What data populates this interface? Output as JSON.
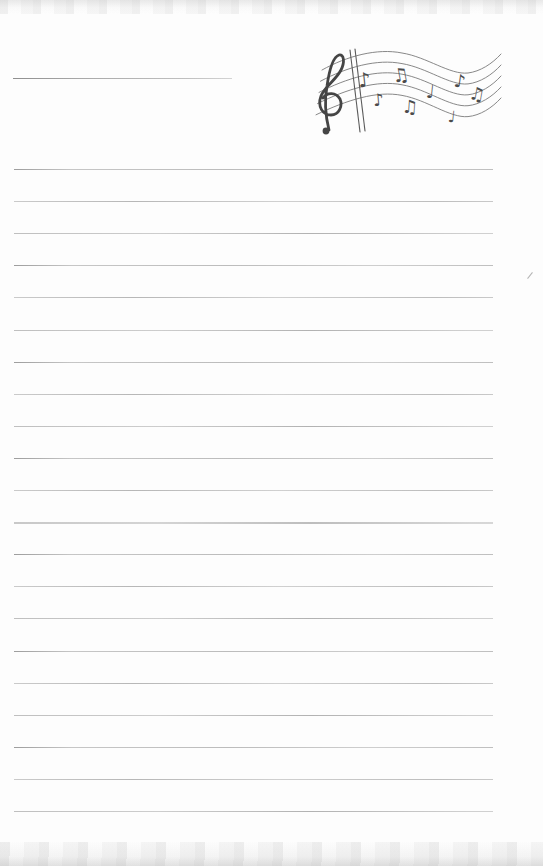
{
  "page": {
    "background_color": "#fdfdfd",
    "edge_texture_color": "#dcdcdc"
  },
  "title_line": {
    "color": "#9e9e9e"
  },
  "ruled_lines": {
    "count": 21,
    "start_y": 169,
    "spacing": 32.1,
    "color": "#c2c2c2",
    "heavy_index": 11
  },
  "music": {
    "label": "wavy five-line staff with treble clef, double barline and notes",
    "ink_color": "#4b4b4b",
    "staff_color": "#7a7a7a",
    "notes": [
      "♪",
      "♫",
      "♪",
      "♫",
      "♩",
      "♪",
      "♫",
      "♩"
    ]
  },
  "stray_mark": {
    "color": "#b4b4b4"
  }
}
